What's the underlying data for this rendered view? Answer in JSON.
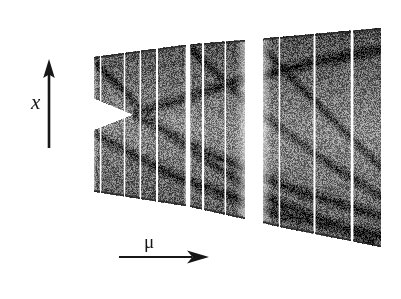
{
  "figure": {
    "kind": "bifurcation-diagram",
    "caption": "",
    "background_color": "#ffffff",
    "frame_color": "#b9b9bb",
    "ink_color": "#171717"
  },
  "labels": {
    "y_axis": "x",
    "x_axis": "μ",
    "y_arrow_icon": "up-arrow-icon",
    "x_arrow_icon": "right-arrow-icon"
  },
  "chart_data": {
    "type": "scatter",
    "title": "",
    "xlabel": "μ",
    "ylabel": "x",
    "grid": false,
    "legend": null,
    "xlim": [
      0,
      1
    ],
    "ylim": [
      0,
      1
    ],
    "tick_labels": {
      "x": [],
      "y": []
    },
    "region": {
      "upper_envelope": [
        [
          0.098,
          0.856
        ],
        [
          0.4,
          0.908
        ],
        [
          0.7,
          0.94
        ],
        [
          1.0,
          0.975
        ]
      ],
      "lower_envelope": [
        [
          0.098,
          0.323
        ],
        [
          0.4,
          0.262
        ],
        [
          0.7,
          0.175
        ],
        [
          1.0,
          0.098
        ]
      ],
      "wedge": {
        "open_at_left_top": 0.7,
        "open_at_left_bottom": 0.56,
        "cusp_mu": 0.231,
        "cusp_x": 0.628
      }
    },
    "periodic_windows": [
      {
        "mu": 0.058,
        "width": 0.006,
        "kind": "thin"
      },
      {
        "mu": 0.1,
        "width": 0.018,
        "kind": "wide"
      },
      {
        "mu": 0.131,
        "width": 0.004,
        "kind": "thin"
      },
      {
        "mu": 0.205,
        "width": 0.004,
        "kind": "thin"
      },
      {
        "mu": 0.254,
        "width": 0.004,
        "kind": "thin"
      },
      {
        "mu": 0.306,
        "width": 0.004,
        "kind": "thin"
      },
      {
        "mu": 0.402,
        "width": 0.012,
        "kind": "wide"
      },
      {
        "mu": 0.449,
        "width": 0.005,
        "kind": "thin"
      },
      {
        "mu": 0.518,
        "width": 0.004,
        "kind": "thin"
      },
      {
        "mu": 0.607,
        "width": 0.055,
        "kind": "window"
      },
      {
        "mu": 0.686,
        "width": 0.004,
        "kind": "thin"
      },
      {
        "mu": 0.795,
        "width": 0.006,
        "kind": "thin"
      },
      {
        "mu": 0.912,
        "width": 0.007,
        "kind": "thin"
      }
    ],
    "internal_caustics": [
      [
        [
          0.098,
          0.856
        ],
        [
          0.33,
          0.56
        ],
        [
          0.63,
          0.3
        ],
        [
          0.98,
          0.12
        ]
      ],
      [
        [
          0.098,
          0.56
        ],
        [
          0.36,
          0.38
        ],
        [
          0.68,
          0.23
        ],
        [
          1.0,
          0.14
        ]
      ],
      [
        [
          0.23,
          0.628
        ],
        [
          0.55,
          0.76
        ],
        [
          0.8,
          0.84
        ],
        [
          1.0,
          0.89
        ]
      ],
      [
        [
          0.23,
          0.628
        ],
        [
          0.47,
          0.47
        ],
        [
          0.72,
          0.33
        ],
        [
          1.0,
          0.22
        ]
      ],
      [
        [
          0.4,
          0.905
        ],
        [
          0.62,
          0.64
        ],
        [
          0.84,
          0.43
        ],
        [
          1.0,
          0.3
        ]
      ],
      [
        [
          0.61,
          0.93
        ],
        [
          0.78,
          0.7
        ],
        [
          0.92,
          0.52
        ],
        [
          1.0,
          0.42
        ]
      ]
    ],
    "density": {
      "scale": "grayscale",
      "dark": "#2b2b2b",
      "mid": "#6f6f6f",
      "light": "#c8c8c8"
    }
  }
}
